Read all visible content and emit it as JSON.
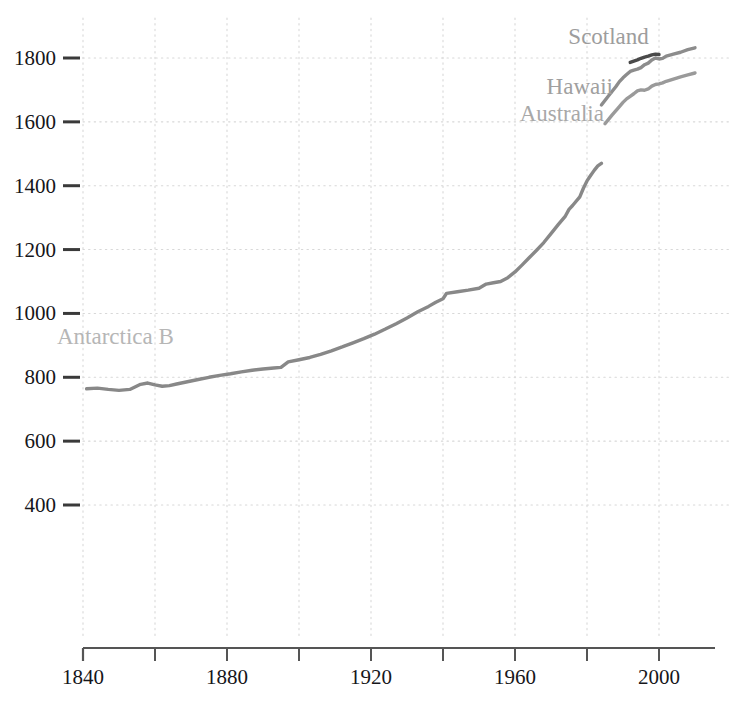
{
  "chart_data": {
    "type": "line",
    "title": "",
    "subtitle": "",
    "xlabel": "",
    "ylabel": "",
    "xlim": [
      1836,
      2012
    ],
    "ylim": [
      330,
      1870
    ],
    "grid": true,
    "grid_style": "dotted",
    "legend_position": "inline-annotations",
    "x_ticks_major": [
      1840,
      1880,
      1920,
      1960,
      2000
    ],
    "x_ticks_minor": [
      1860,
      1900,
      1940,
      1980
    ],
    "x_tick_labels": [
      "1840",
      "1880",
      "1920",
      "1960",
      "2000"
    ],
    "y_ticks": [
      400,
      600,
      800,
      1000,
      1200,
      1400,
      1600,
      1800
    ],
    "y_tick_labels": [
      "400",
      "600",
      "800",
      "1000",
      "1200",
      "1400",
      "1600",
      "1800"
    ],
    "series": [
      {
        "name": "Antarctica B",
        "label": "Antarctica B",
        "color": "#888888",
        "label_color": "#b6b6b6",
        "label_x": 1849,
        "label_y": 905,
        "points": [
          [
            1841,
            764
          ],
          [
            1844,
            766
          ],
          [
            1847,
            762
          ],
          [
            1850,
            759
          ],
          [
            1853,
            762
          ],
          [
            1856,
            778
          ],
          [
            1858,
            782
          ],
          [
            1860,
            776
          ],
          [
            1862,
            772
          ],
          [
            1864,
            774
          ],
          [
            1866,
            779
          ],
          [
            1869,
            786
          ],
          [
            1872,
            793
          ],
          [
            1875,
            800
          ],
          [
            1878,
            806
          ],
          [
            1881,
            811
          ],
          [
            1884,
            817
          ],
          [
            1887,
            822
          ],
          [
            1890,
            826
          ],
          [
            1893,
            829
          ],
          [
            1895,
            831
          ],
          [
            1897,
            848
          ],
          [
            1900,
            855
          ],
          [
            1903,
            862
          ],
          [
            1906,
            872
          ],
          [
            1909,
            883
          ],
          [
            1912,
            895
          ],
          [
            1915,
            908
          ],
          [
            1918,
            921
          ],
          [
            1921,
            935
          ],
          [
            1924,
            951
          ],
          [
            1927,
            968
          ],
          [
            1930,
            986
          ],
          [
            1933,
            1005
          ],
          [
            1936,
            1022
          ],
          [
            1938,
            1035
          ],
          [
            1940,
            1046
          ],
          [
            1941,
            1063
          ],
          [
            1944,
            1068
          ],
          [
            1947,
            1073
          ],
          [
            1950,
            1079
          ],
          [
            1952,
            1092
          ],
          [
            1954,
            1096
          ],
          [
            1956,
            1100
          ],
          [
            1958,
            1112
          ],
          [
            1960,
            1130
          ],
          [
            1962,
            1152
          ],
          [
            1964,
            1175
          ],
          [
            1966,
            1198
          ],
          [
            1968,
            1222
          ],
          [
            1970,
            1250
          ],
          [
            1972,
            1278
          ],
          [
            1974,
            1305
          ],
          [
            1975,
            1326
          ],
          [
            1976,
            1338
          ],
          [
            1978,
            1365
          ],
          [
            1979,
            1392
          ],
          [
            1980,
            1415
          ],
          [
            1981,
            1432
          ],
          [
            1982,
            1448
          ],
          [
            1983,
            1462
          ],
          [
            1984,
            1470
          ]
        ]
      },
      {
        "name": "Australia",
        "label": "Australia",
        "color": "#9a9a9a",
        "label_color": "#a8a8a8",
        "label_x": 1973,
        "label_y": 1602,
        "points": [
          [
            1985,
            1594
          ],
          [
            1987,
            1622
          ],
          [
            1989,
            1648
          ],
          [
            1990,
            1661
          ],
          [
            1991,
            1672
          ],
          [
            1992,
            1680
          ],
          [
            1993,
            1688
          ],
          [
            1994,
            1697
          ],
          [
            1995,
            1700
          ],
          [
            1996,
            1699
          ],
          [
            1997,
            1703
          ],
          [
            1998,
            1712
          ],
          [
            1999,
            1717
          ],
          [
            2000,
            1719
          ],
          [
            2001,
            1722
          ],
          [
            2002,
            1727
          ],
          [
            2004,
            1734
          ],
          [
            2006,
            1741
          ],
          [
            2008,
            1747
          ],
          [
            2010,
            1753
          ]
        ]
      },
      {
        "name": "Hawaii",
        "label": "Hawaii",
        "color": "#8c8c8c",
        "label_color": "#a0a0a0",
        "label_x": 1978,
        "label_y": 1686,
        "points": [
          [
            1984,
            1653
          ],
          [
            1986,
            1682
          ],
          [
            1988,
            1710
          ],
          [
            1989,
            1726
          ],
          [
            1990,
            1738
          ],
          [
            1991,
            1748
          ],
          [
            1992,
            1758
          ],
          [
            1993,
            1762
          ],
          [
            1994,
            1765
          ],
          [
            1995,
            1770
          ],
          [
            1996,
            1779
          ],
          [
            1997,
            1784
          ],
          [
            1998,
            1794
          ],
          [
            1999,
            1800
          ],
          [
            2000,
            1797
          ],
          [
            2001,
            1799
          ],
          [
            2002,
            1806
          ],
          [
            2004,
            1812
          ],
          [
            2006,
            1818
          ],
          [
            2008,
            1826
          ],
          [
            2010,
            1832
          ]
        ]
      },
      {
        "name": "Scotland",
        "label": "Scotland",
        "color": "#4a4a4a",
        "label_color": "#9d9d9d",
        "label_x": 1986,
        "label_y": 1845,
        "points": [
          [
            1992,
            1786
          ],
          [
            1993,
            1790
          ],
          [
            1994,
            1794
          ],
          [
            1995,
            1799
          ],
          [
            1996,
            1803
          ],
          [
            1997,
            1806
          ],
          [
            1998,
            1810
          ],
          [
            1999,
            1812
          ],
          [
            2000,
            1811
          ]
        ]
      }
    ]
  },
  "axes": {
    "x_axis_name": "year-axis",
    "y_axis_name": "value-axis"
  },
  "colors": {
    "gridline": "#d8d8d8",
    "axis": "#555555",
    "tick_mark": "#3a3a3a",
    "background": "#ffffff"
  }
}
